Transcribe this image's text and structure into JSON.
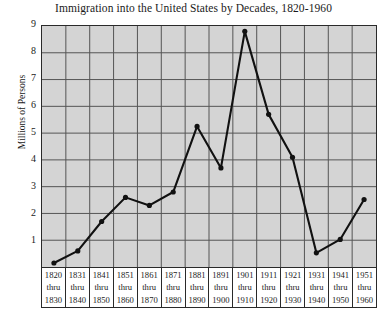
{
  "chart_data": {
    "type": "line",
    "title": "Immigration into the United States by Decades, 1820-1960",
    "xlabel": "",
    "ylabel": "Millions of Persons",
    "ylim": [
      0,
      9
    ],
    "yticks": [
      1,
      2,
      3,
      4,
      5,
      6,
      7,
      8,
      9
    ],
    "grid": true,
    "legend": null,
    "categories": [
      "1820 thru 1830",
      "1831 thru 1840",
      "1841 thru 1850",
      "1851 thru 1860",
      "1861 thru 1870",
      "1871 thru 1880",
      "1881 thru 1890",
      "1891 thru 1900",
      "1901 thru 1910",
      "1911 thru 1920",
      "1921 thru 1930",
      "1931 thru 1940",
      "1941 thru 1950",
      "1951 thru 1960"
    ],
    "category_lines": [
      [
        "1820",
        "thru",
        "1830"
      ],
      [
        "1831",
        "thru",
        "1840"
      ],
      [
        "1841",
        "thru",
        "1850"
      ],
      [
        "1851",
        "thru",
        "1860"
      ],
      [
        "1861",
        "thru",
        "1870"
      ],
      [
        "1871",
        "thru",
        "1880"
      ],
      [
        "1881",
        "thru",
        "1890"
      ],
      [
        "1891",
        "thru",
        "1900"
      ],
      [
        "1901",
        "thru",
        "1910"
      ],
      [
        "1911",
        "thru",
        "1920"
      ],
      [
        "1921",
        "thru",
        "1930"
      ],
      [
        "1931",
        "thru",
        "1940"
      ],
      [
        "1941",
        "thru",
        "1950"
      ],
      [
        "1951",
        "thru",
        "1960"
      ]
    ],
    "values": [
      0.15,
      0.6,
      1.7,
      2.6,
      2.3,
      2.8,
      5.25,
      3.7,
      8.8,
      5.7,
      4.1,
      0.53,
      1.03,
      2.52
    ],
    "series_color": "#111111",
    "plot_background": "#d4d4d4",
    "grid_color": "#555555",
    "axis_color": "#2a2a2a"
  }
}
